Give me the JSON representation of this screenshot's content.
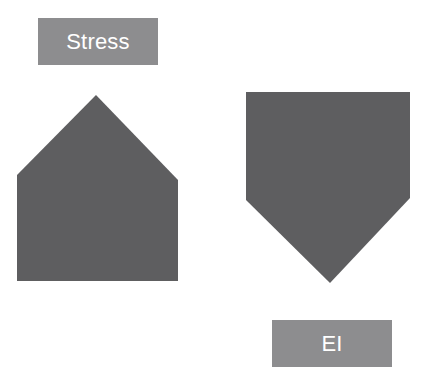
{
  "canvas": {
    "width": 423,
    "height": 380,
    "background": "#ffffff"
  },
  "palette": {
    "shape_fill": "#5e5e60",
    "label_fill": "#8d8d8f",
    "label_text": "#ffffff"
  },
  "labels": [
    {
      "id": "stress",
      "text": "Stress",
      "x": 38,
      "y": 18,
      "width": 120,
      "height": 47,
      "font_size": 22,
      "fill": "#8d8d8f",
      "color": "#ffffff"
    },
    {
      "id": "ei",
      "text": "EI",
      "x": 272,
      "y": 320,
      "width": 120,
      "height": 47,
      "font_size": 22,
      "fill": "#8d8d8f",
      "color": "#ffffff"
    }
  ],
  "shapes": [
    {
      "id": "stress-pentagon",
      "name": "house-pentagon-up",
      "fill": "#5e5e60",
      "points": "96,95 178,180 178,281 17,281 17,175",
      "viewbox": "0 0 423 380"
    },
    {
      "id": "ei-pentagon",
      "name": "home-plate-pentagon-down",
      "fill": "#5e5e60",
      "points": "246,92 410,92 410,198 330,283 246,200",
      "viewbox": "0 0 423 380"
    }
  ]
}
